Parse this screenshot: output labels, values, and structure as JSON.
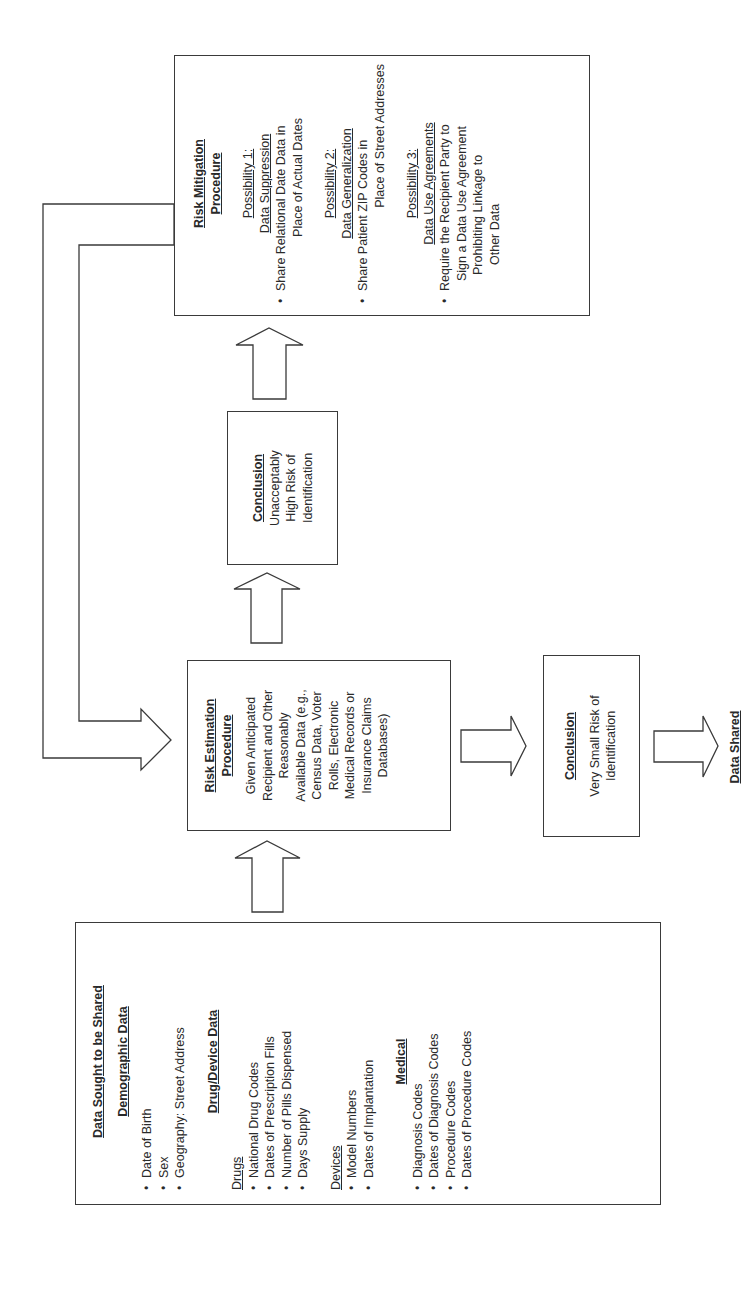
{
  "source_box": {
    "title": "Data Sought to be Shared",
    "demographic": {
      "heading": "Demographic Data",
      "items": [
        "Date of Birth",
        "Sex",
        "Geography: Street Address"
      ]
    },
    "drug_device": {
      "heading": "Drug/Device Data",
      "drugs": {
        "subheading": "Drugs",
        "items": [
          "National Drug Codes",
          "Dates of Prescription Fills",
          "Number of Pills Dispensed",
          "Days Supply"
        ]
      },
      "devices": {
        "subheading": "Devices",
        "items": [
          "Model Numbers",
          "Dates of Implantation"
        ]
      }
    },
    "medical": {
      "heading": "Medical",
      "items": [
        "Diagnosis Codes",
        "Dates of Diagnosis Codes",
        "Procedure Codes",
        "Dates of Procedure Codes"
      ]
    }
  },
  "risk_estimation": {
    "title_line1": "Risk Estimation",
    "title_line2": "Procedure",
    "lines": [
      "Given Anticipated",
      "Recipient and Other",
      "Reasonably",
      "Available Data (e.g.,",
      "Census Data, Voter",
      "Rolls, Electronic",
      "Medical Records or",
      "Insurance Claims",
      "Databases)"
    ]
  },
  "conclusion_high": {
    "title": "Conclusion",
    "lines": [
      "Unacceptably",
      "High Risk of",
      "Identification"
    ]
  },
  "conclusion_low": {
    "title": "Conclusion",
    "lines": [
      "Very Small Risk of",
      "Identification"
    ]
  },
  "risk_mitigation": {
    "title_line1": "Risk Mitigation",
    "title_line2": "Procedure",
    "possibilities": [
      {
        "label": "Possibility 1:",
        "name": "Data Suppression",
        "bullet_lines": [
          "Share Relational Date Data in",
          "Place of Actual Dates"
        ]
      },
      {
        "label": "Possibility 2:",
        "name": "Data Generalization",
        "bullet_lines": [
          "Share Patient ZIP Codes in",
          "Place of Street Addresses"
        ]
      },
      {
        "label": "Possibility 3:",
        "name": "Data Use Agreements",
        "bullet_lines": [
          "Require the Recipient Party to",
          "Sign a Data Use Agreement",
          "Prohibiting Linkage to",
          "Other Data"
        ]
      }
    ]
  },
  "outcome": {
    "label": "Data Shared"
  },
  "colors": {
    "line": "#3a3a3a",
    "text": "#2a2a2a",
    "background": "#ffffff"
  }
}
